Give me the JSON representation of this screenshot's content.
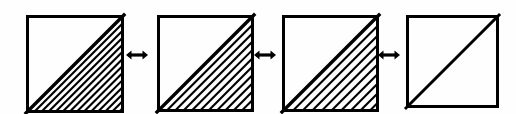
{
  "figure": {
    "background_color": "#fefefe",
    "ink_color": "#000000",
    "width": 516,
    "height": 114
  },
  "squares": [
    {
      "id": "square-1",
      "label": "hatched square 1",
      "x": 22,
      "y": 11,
      "size": 98,
      "border_width": 3,
      "diagonal": "bottom-left-to-top-right",
      "diagonal_width": 3.4,
      "shaded_region": "lower-right-triangle",
      "hatch": true,
      "hatch_angle_deg": 45,
      "hatch_spacing": 5.0,
      "hatch_width": 2.1
    },
    {
      "id": "square-2",
      "label": "hatched square 2",
      "x": 153,
      "y": 11,
      "size": 97,
      "border_width": 3,
      "diagonal": "bottom-left-to-top-right",
      "diagonal_width": 3.4,
      "shaded_region": "lower-right-triangle",
      "hatch": true,
      "hatch_angle_deg": 45,
      "hatch_spacing": 5.9,
      "hatch_width": 2.1
    },
    {
      "id": "square-3",
      "label": "hatched square 3",
      "x": 278,
      "y": 11,
      "size": 97,
      "border_width": 3,
      "diagonal": "bottom-left-to-top-right",
      "diagonal_width": 3.4,
      "shaded_region": "lower-right-triangle",
      "hatch": true,
      "hatch_angle_deg": 45,
      "hatch_spacing": 6.8,
      "hatch_width": 2.1
    },
    {
      "id": "square-4",
      "label": "plain square with diagonal",
      "x": 402,
      "y": 11,
      "size": 93,
      "border_width": 3,
      "diagonal": "bottom-left-to-top-right",
      "diagonal_width": 3.0,
      "shaded_region": "none",
      "hatch": false,
      "hatch_angle_deg": 45,
      "hatch_spacing": 0,
      "hatch_width": 0
    }
  ],
  "arrows": [
    {
      "id": "arrow-1",
      "label": "double-headed arrow between square 1 and square 2",
      "glyph": "双",
      "symbol": "↔",
      "x": 126,
      "y": 48,
      "width": 22,
      "height": 14
    },
    {
      "id": "arrow-2",
      "label": "double-headed arrow between square 2 and square 3",
      "glyph": "双",
      "symbol": "↔",
      "x": 254,
      "y": 48,
      "width": 22,
      "height": 14
    },
    {
      "id": "arrow-3",
      "label": "double-headed arrow between square 3 and square 4",
      "glyph": "双",
      "symbol": "↔",
      "x": 378,
      "y": 48,
      "width": 22,
      "height": 14
    }
  ]
}
